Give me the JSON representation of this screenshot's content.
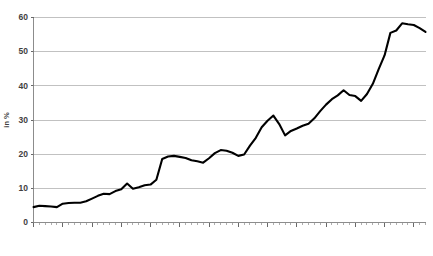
{
  "chart_data": {
    "type": "line",
    "title": "",
    "subtitle": "",
    "xlabel": "",
    "ylabel": "in %",
    "xlim": [
      1950,
      2017
    ],
    "ylim": [
      0,
      60
    ],
    "grid": true,
    "legend": false,
    "legend_position": "none",
    "line_color": "#000000",
    "grid_color": "#a6a6a6",
    "y_ticks": [
      0,
      10,
      20,
      30,
      40,
      50,
      60
    ],
    "y_tick_labels": [
      "0",
      "10",
      "20",
      "30",
      "40",
      "50",
      "60"
    ],
    "x_ticks": [
      1950,
      1955,
      1960,
      1965,
      1970,
      1975,
      1980,
      1985,
      1990,
      1995,
      2000,
      2005,
      2010,
      2015
    ],
    "x_tick_labels": [
      "1950",
      "1955",
      "1960",
      "1965",
      "1970",
      "1975",
      "1980",
      "1985",
      "1990",
      "1995",
      "2000",
      "2005",
      "2010",
      "2015"
    ],
    "x_minor_tick_step": 1,
    "series": [
      {
        "name": "in %",
        "x": [
          1950,
          1951,
          1952,
          1953,
          1954,
          1955,
          1956,
          1957,
          1958,
          1959,
          1960,
          1961,
          1962,
          1963,
          1964,
          1965,
          1966,
          1967,
          1968,
          1969,
          1970,
          1971,
          1972,
          1973,
          1974,
          1975,
          1976,
          1977,
          1978,
          1979,
          1980,
          1981,
          1982,
          1983,
          1984,
          1985,
          1986,
          1987,
          1988,
          1989,
          1990,
          1991,
          1992,
          1993,
          1994,
          1995,
          1996,
          1997,
          1998,
          1999,
          2000,
          2001,
          2002,
          2003,
          2004,
          2005,
          2006,
          2007,
          2008,
          2009,
          2010,
          2011,
          2012,
          2013,
          2014,
          2015,
          2016,
          2017
        ],
        "values": [
          4.5,
          4.9,
          4.8,
          4.7,
          4.5,
          5.5,
          5.7,
          5.8,
          5.8,
          6.2,
          7.0,
          7.8,
          8.4,
          8.3,
          9.2,
          9.7,
          11.4,
          9.9,
          10.3,
          10.9,
          11.1,
          12.5,
          18.6,
          19.3,
          19.5,
          19.2,
          18.9,
          18.2,
          17.9,
          17.5,
          18.8,
          20.3,
          21.2,
          21.0,
          20.4,
          19.5,
          19.9,
          22.5,
          24.8,
          27.9,
          29.8,
          31.3,
          28.8,
          25.5,
          26.8,
          27.5,
          28.3,
          28.9,
          30.5,
          32.6,
          34.5,
          36.1,
          37.2,
          38.7,
          37.3,
          37.0,
          35.6,
          37.6,
          40.6,
          44.9,
          48.9,
          55.5,
          56.2,
          58.3,
          58.0,
          57.8,
          56.9,
          55.8
        ]
      }
    ]
  },
  "axis_labels": {
    "y_axis_title": "in %"
  }
}
